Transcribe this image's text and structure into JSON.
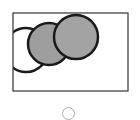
{
  "figure": {
    "frame": {
      "x": 13,
      "y": 13,
      "width": 115,
      "height": 78,
      "stroke": "#333333"
    },
    "circles": [
      {
        "name": "white-circle",
        "cx": 26,
        "cy": 50,
        "r": 22,
        "fill": "#ffffff"
      },
      {
        "name": "gray-circle-middle",
        "cx": 49,
        "cy": 44,
        "r": 21,
        "fill": "#9e9e9e"
      },
      {
        "name": "gray-circle-right",
        "cx": 76,
        "cy": 37,
        "r": 22,
        "fill": "#a3a3a3"
      }
    ],
    "stroke_color": "#1a1a1a"
  },
  "radio": {
    "selected": false,
    "border_color": "#a8a8a8"
  }
}
